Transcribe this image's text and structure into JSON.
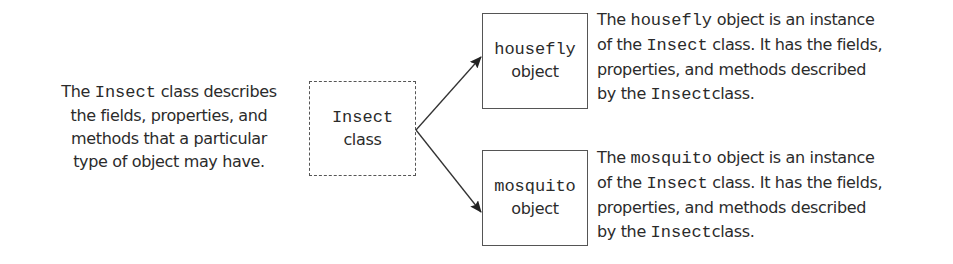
{
  "class_description": {
    "lines": [
      {
        "pre": "The ",
        "code": "Insect",
        "post": " class describes"
      },
      {
        "pre": "the fields, properties, and",
        "code": "",
        "post": ""
      },
      {
        "pre": "methods that a particular",
        "code": "",
        "post": ""
      },
      {
        "pre": "type of object may have.",
        "code": "",
        "post": ""
      }
    ]
  },
  "class_box": {
    "name": "Insect",
    "kind": "class",
    "border_style": "dashed"
  },
  "objects": [
    {
      "name": "housefly",
      "kind": "object",
      "description": {
        "lines": [
          {
            "pre": "The ",
            "code": "housefly",
            "post": " object is an instance"
          },
          {
            "pre": "of the ",
            "code": "Insect",
            "post": " class. It has the fields,"
          },
          {
            "pre": "properties, and methods described",
            "code": "",
            "post": ""
          },
          {
            "pre": "by the ",
            "code": "Insect",
            "post": "class."
          }
        ]
      }
    },
    {
      "name": "mosquito",
      "kind": "object",
      "description": {
        "lines": [
          {
            "pre": "The ",
            "code": "mosquito",
            "post": " object is an instance"
          },
          {
            "pre": "of the ",
            "code": "Insect",
            "post": " class. It has the fields,"
          },
          {
            "pre": "properties, and methods described",
            "code": "",
            "post": ""
          },
          {
            "pre": "by the ",
            "code": "Insect",
            "post": "class."
          }
        ]
      }
    }
  ],
  "arrows": [
    {
      "from": "Insect class",
      "to": "housefly object"
    },
    {
      "from": "Insect class",
      "to": "mosquito object"
    }
  ],
  "colors": {
    "text": "#2b2b2b",
    "box_border": "#555555",
    "arrow": "#333333",
    "background": "#ffffff"
  }
}
